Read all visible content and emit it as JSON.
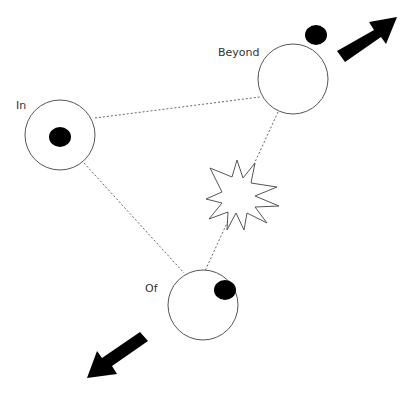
{
  "diagram": {
    "nodes": [
      {
        "id": "in",
        "label": "In",
        "cx": 60,
        "cy": 135,
        "r": 35,
        "dot": {
          "cx": 60,
          "cy": 137,
          "rx": 11,
          "ry": 10
        }
      },
      {
        "id": "beyond",
        "label": "Beyond",
        "cx": 293,
        "cy": 79,
        "r": 35,
        "dot": {
          "cx": 316,
          "cy": 35,
          "rx": 11,
          "ry": 10
        }
      },
      {
        "id": "of",
        "label": "Of",
        "cx": 203,
        "cy": 305,
        "r": 35,
        "dot": {
          "cx": 225,
          "cy": 290,
          "rx": 11,
          "ry": 10
        }
      }
    ],
    "connections": [
      {
        "from": "in",
        "to": "beyond",
        "style": "dotted"
      },
      {
        "from": "in",
        "to": "of",
        "style": "dotted"
      },
      {
        "from": "beyond",
        "to": "of",
        "style": "dotted"
      }
    ],
    "explosion": {
      "cx": 237,
      "cy": 194
    },
    "arrows": [
      {
        "direction": "up-right",
        "near": "beyond"
      },
      {
        "direction": "down-left",
        "near": "of"
      }
    ],
    "colors": {
      "stroke": "#555555",
      "fill": "#000000",
      "line": "#666666"
    }
  }
}
